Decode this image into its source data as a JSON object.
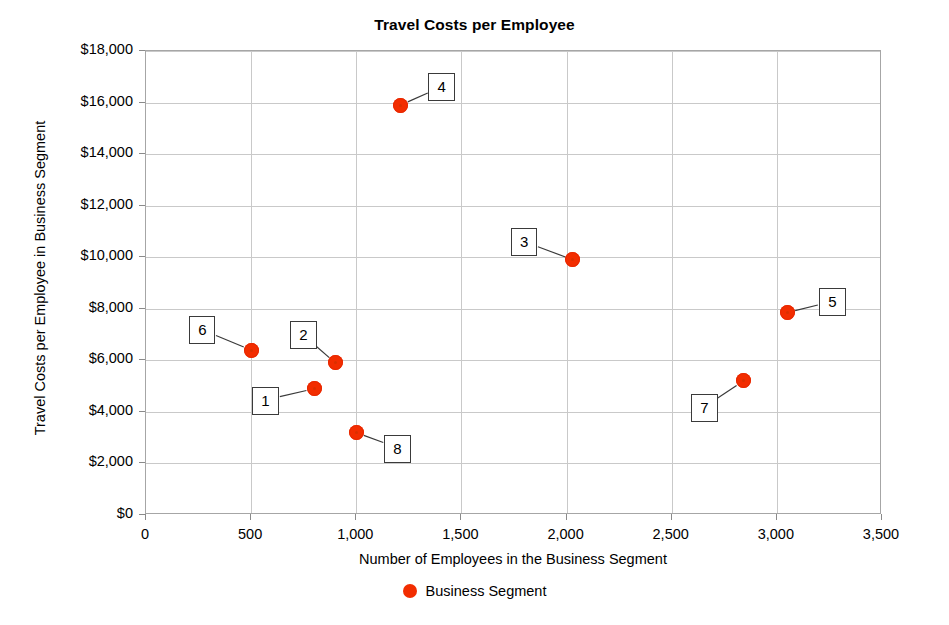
{
  "chart_data": {
    "type": "scatter",
    "title": "Travel Costs per Employee",
    "xlabel": "Number of Employees in the Business Segment",
    "ylabel": "Travel Costs per Employee in Business Segment",
    "xlim": [
      0,
      3500
    ],
    "ylim": [
      0,
      18000
    ],
    "xticks": [
      "0",
      "500",
      "1,000",
      "1,500",
      "2,000",
      "2,500",
      "3,000",
      "3,500"
    ],
    "xtick_values": [
      0,
      500,
      1000,
      1500,
      2000,
      2500,
      3000,
      3500
    ],
    "yticks": [
      "$0",
      "$2,000",
      "$4,000",
      "$6,000",
      "$8,000",
      "$10,000",
      "$12,000",
      "$14,000",
      "$16,000",
      "$18,000"
    ],
    "ytick_values": [
      0,
      2000,
      4000,
      6000,
      8000,
      10000,
      12000,
      14000,
      16000,
      18000
    ],
    "grid": true,
    "legend_position": "bottom",
    "marker_color": "#f22d00",
    "series": [
      {
        "name": "Business Segment",
        "color": "#f22d00",
        "points": [
          {
            "label": "1",
            "x": 800,
            "y": 4900,
            "label_dx": -62,
            "label_dy": -2
          },
          {
            "label": "2",
            "x": 900,
            "y": 5900,
            "label_dx": -45,
            "label_dy": -42
          },
          {
            "label": "3",
            "x": 2030,
            "y": 9900,
            "label_dx": -62,
            "label_dy": -32
          },
          {
            "label": "4",
            "x": 1210,
            "y": 15900,
            "label_dx": 28,
            "label_dy": -32
          },
          {
            "label": "5",
            "x": 3050,
            "y": 7850,
            "label_dx": 32,
            "label_dy": -25
          },
          {
            "label": "6",
            "x": 500,
            "y": 6400,
            "label_dx": -62,
            "label_dy": -34
          },
          {
            "label": "7",
            "x": 2840,
            "y": 5200,
            "label_dx": -52,
            "label_dy": 13
          },
          {
            "label": "8",
            "x": 1000,
            "y": 3200,
            "label_dx": 28,
            "label_dy": 2
          }
        ]
      }
    ]
  },
  "legend": {
    "label": "Business Segment"
  }
}
